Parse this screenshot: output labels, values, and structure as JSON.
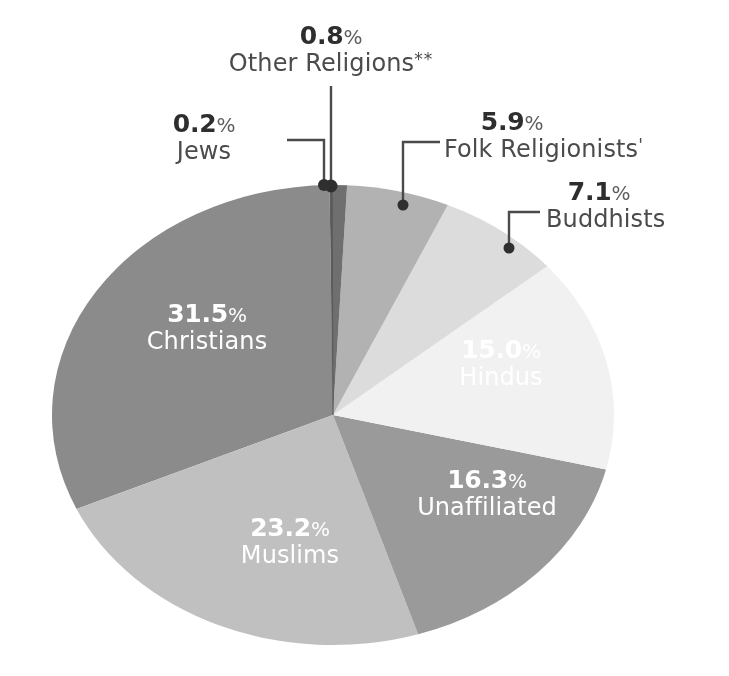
{
  "chart_data": {
    "type": "pie",
    "title": "",
    "subtitle": "",
    "xlabel": "",
    "ylabel": "",
    "legend_position": "none",
    "grid": false,
    "value_unit": "%",
    "total": 100.0,
    "categories": [
      "Other Religions",
      "Folk Religionists",
      "Buddhists",
      "Hindus",
      "Unaffiliated",
      "Muslims",
      "Christians",
      "Jews"
    ],
    "values": [
      0.8,
      5.9,
      7.1,
      15.0,
      16.3,
      23.2,
      31.5,
      0.2
    ],
    "slices": [
      {
        "name": "Other Religions",
        "name_marker": "**",
        "value": 0.8,
        "value_label": "0.8%",
        "color": "#6f6f6f",
        "label_style": "callout",
        "label_color": "#3f3f3f"
      },
      {
        "name": "Folk Religionists",
        "name_marker": "'",
        "value": 5.9,
        "value_label": "5.9%",
        "color": "#b2b2b2",
        "label_style": "callout",
        "label_color": "#3f3f3f"
      },
      {
        "name": "Buddhists",
        "name_marker": "",
        "value": 7.1,
        "value_label": "7.1%",
        "color": "#dcdcdc",
        "label_style": "callout",
        "label_color": "#3f3f3f"
      },
      {
        "name": "Hindus",
        "name_marker": "",
        "value": 15.0,
        "value_label": "15.0%",
        "color": "#f1f1f1",
        "label_style": "inline",
        "label_color": "#ffffff"
      },
      {
        "name": "Unaffiliated",
        "name_marker": "",
        "value": 16.3,
        "value_label": "16.3%",
        "color": "#9a9a9a",
        "label_style": "inline",
        "label_color": "#ffffff"
      },
      {
        "name": "Muslims",
        "name_marker": "",
        "value": 23.2,
        "value_label": "23.2%",
        "color": "#c0c0c0",
        "label_style": "inline",
        "label_color": "#ffffff"
      },
      {
        "name": "Christians",
        "name_marker": "",
        "value": 31.5,
        "value_label": "31.5%",
        "color": "#8b8b8b",
        "label_style": "inline",
        "label_color": "#ffffff"
      },
      {
        "name": "Jews",
        "name_marker": "",
        "value": 0.2,
        "value_label": "0.2%",
        "color": "#5f5f5f",
        "label_style": "callout",
        "label_color": "#3f3f3f"
      }
    ]
  },
  "labels": {
    "other_religions": {
      "pct": "0.8",
      "sym": "%",
      "name": "Other Religions",
      "marker": "**"
    },
    "folk_religionists": {
      "pct": "5.9",
      "sym": "%",
      "name": "Folk Religionists",
      "marker": "'"
    },
    "buddhists": {
      "pct": "7.1",
      "sym": "%",
      "name": "Buddhists",
      "marker": ""
    },
    "hindus": {
      "pct": "15.0",
      "sym": "%",
      "name": "Hindus",
      "marker": ""
    },
    "unaffiliated": {
      "pct": "16.3",
      "sym": "%",
      "name": "Unaffiliated",
      "marker": ""
    },
    "muslims": {
      "pct": "23.2",
      "sym": "%",
      "name": "Muslims",
      "marker": ""
    },
    "christians": {
      "pct": "31.5",
      "sym": "%",
      "name": "Christians",
      "marker": ""
    },
    "jews": {
      "pct": "0.2",
      "sym": "%",
      "name": "Jews",
      "marker": ""
    }
  },
  "style": {
    "background": "#ffffff",
    "leader_line_color": "#4a4a4a",
    "callout_text_color": "#3f3f3f",
    "inline_text_color": "#ffffff"
  }
}
